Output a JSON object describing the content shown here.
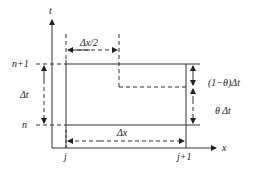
{
  "diagram": {
    "axes": {
      "t_label": "t",
      "x_label": "x"
    },
    "time_levels": {
      "upper": "n+1",
      "lower": "n"
    },
    "space_nodes": {
      "left": "j",
      "right": "j+1"
    },
    "dimensions": {
      "half_dx": "Δx/2",
      "dt": "Δt",
      "dx": "Δx",
      "one_minus_theta_dt": "(1−θ)Δt",
      "theta_dt": "θ Δt"
    },
    "colors": {
      "line": "#333333",
      "background": "#ffffff"
    }
  }
}
